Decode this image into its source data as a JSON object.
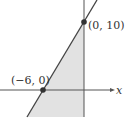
{
  "diagram": {
    "type": "linear-inequality-graph",
    "axes": {
      "x_label": "x"
    },
    "points": [
      {
        "label": "(0, 10)",
        "x": 0,
        "y": 10
      },
      {
        "label": "(−6, 0)",
        "x": -6,
        "y": 0
      }
    ],
    "line": {
      "through": [
        "(-6, 0)",
        "(0, 10)"
      ]
    },
    "region": {
      "shaded": "between line and y-axis, below line",
      "fill": "#e2e2e2"
    },
    "colors": {
      "line": "#444444",
      "axis": "#555555",
      "shade": "#e2e2e2",
      "point": "#333333"
    }
  }
}
